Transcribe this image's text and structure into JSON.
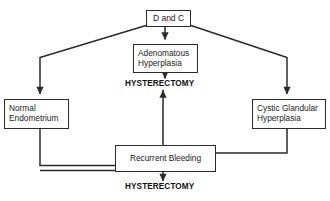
{
  "diagram": {
    "background_color": "#ffffff",
    "line_color": "#2b2b2b",
    "text_color": "#1a1a1a",
    "nodes": {
      "dandc": {
        "label": "D and C",
        "shape": "rectangle"
      },
      "adenomatous": {
        "line1": "Adenomatous",
        "line2": "Hyperplasia",
        "shape": "rectangle"
      },
      "normal": {
        "line1": "Normal",
        "line2": "Endometrium",
        "shape": "rectangle"
      },
      "cystic": {
        "line1": "Cystic Glandular",
        "line2": "Hyperplasia",
        "shape": "rectangle"
      },
      "recurrent": {
        "label": "Recurrent Bleeding",
        "shape": "rectangle"
      }
    },
    "labels": {
      "hysterectomy_top": "HYSTERECTOMY",
      "hysterectomy_bottom": "HYSTERECTOMY"
    },
    "edges": [
      {
        "from": "dandc",
        "to": "normal",
        "style": "elbow-diagonal-left",
        "arrow": "down"
      },
      {
        "from": "dandc",
        "to": "adenomatous",
        "style": "straight-vertical",
        "arrow": "down"
      },
      {
        "from": "dandc",
        "to": "cystic",
        "style": "elbow-diagonal-right",
        "arrow": "down"
      },
      {
        "from": "adenomatous",
        "to": "hysterectomy_top",
        "style": "straight-vertical",
        "arrow": "down"
      },
      {
        "from": "normal",
        "to": "recurrent",
        "style": "elbow-down-right",
        "arrow": "none"
      },
      {
        "from": "cystic",
        "to": "recurrent",
        "style": "elbow-down-left",
        "arrow": "none"
      },
      {
        "from": "recurrent",
        "to": "hysterectomy_top",
        "style": "straight-vertical",
        "arrow": "up"
      },
      {
        "from": "recurrent",
        "to": "hysterectomy_bottom",
        "style": "straight-vertical",
        "arrow": "down"
      }
    ]
  }
}
